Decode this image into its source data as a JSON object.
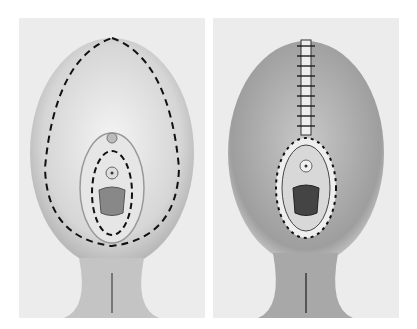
{
  "figure": {
    "panels": [
      {
        "id": "left",
        "description": "pre-operative view with dashed excision lines"
      },
      {
        "id": "right",
        "description": "post-operative view with sutured closure"
      }
    ],
    "colors": {
      "background": "#ececec",
      "skin_shadow": "#9a9a9a",
      "line": "#111111"
    }
  }
}
